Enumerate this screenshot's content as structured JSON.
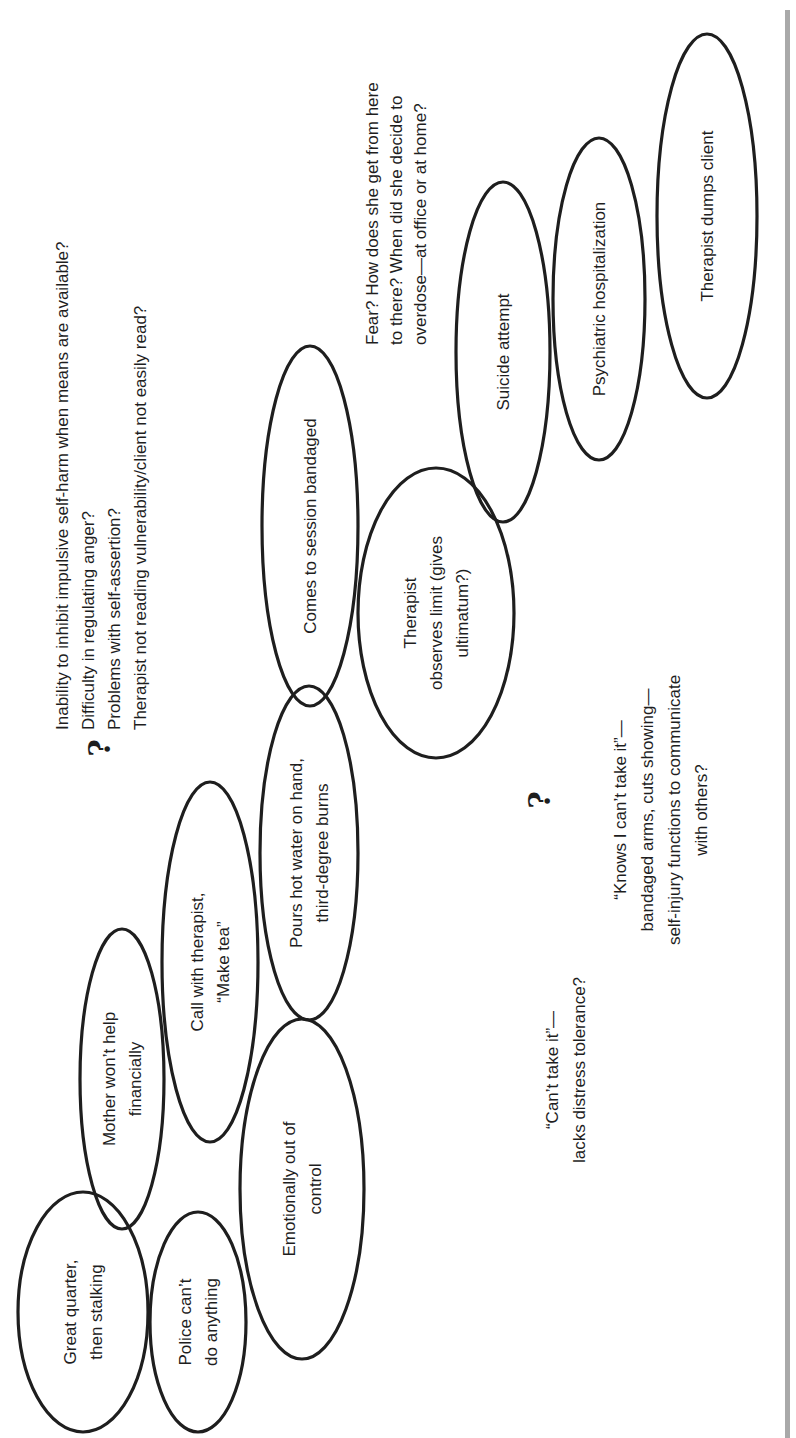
{
  "figure": {
    "orientation": "rotated-90-ccw",
    "colors": {
      "stroke": "#1e1e1e",
      "text": "#1e1e1e",
      "side_bar": "#a9a9a9",
      "background": "#ffffff"
    },
    "nodes": [
      {
        "id": "great-quarter",
        "lines": [
          "Great quarter,",
          "then stalking"
        ],
        "cx": 83,
        "cy": 1312,
        "rx": 65,
        "ry": 120
      },
      {
        "id": "police",
        "lines": [
          "Police can’t",
          "do anything"
        ],
        "cx": 198,
        "cy": 1322,
        "rx": 48,
        "ry": 110
      },
      {
        "id": "mother",
        "lines": [
          "Mother won’t help",
          "financially"
        ],
        "cx": 122,
        "cy": 1079,
        "rx": 42,
        "ry": 150
      },
      {
        "id": "call-therapist",
        "lines": [
          "Call with therapist,",
          "“Make tea”"
        ],
        "cx": 210,
        "cy": 962,
        "rx": 48,
        "ry": 180
      },
      {
        "id": "emotionally",
        "lines": [
          "Emotionally out of",
          "control"
        ],
        "cx": 302,
        "cy": 1189,
        "rx": 62,
        "ry": 170
      },
      {
        "id": "pours-water",
        "lines": [
          "Pours hot water on hand,",
          "third-degree burns"
        ],
        "cx": 309,
        "cy": 853,
        "rx": 49,
        "ry": 167
      },
      {
        "id": "comes-bandaged",
        "lines": [
          "Comes to session bandaged"
        ],
        "cx": 310,
        "cy": 526,
        "rx": 48,
        "ry": 180
      },
      {
        "id": "observes-limit",
        "lines": [
          "Therapist",
          "observes limit (gives",
          "ultimatum?)"
        ],
        "cx": 436,
        "cy": 613,
        "rx": 78,
        "ry": 145
      },
      {
        "id": "suicide-attempt",
        "lines": [
          "Suicide attempt"
        ],
        "cx": 503,
        "cy": 352,
        "rx": 47,
        "ry": 170
      },
      {
        "id": "hospitalization",
        "lines": [
          "Psychiatric hospitalization"
        ],
        "cx": 599,
        "cy": 299,
        "rx": 46,
        "ry": 161
      },
      {
        "id": "dumps-client",
        "lines": [
          "Therapist dumps client"
        ],
        "cx": 707,
        "cy": 216,
        "rx": 50,
        "ry": 182
      }
    ],
    "question_marks": [
      {
        "id": "qmark-top",
        "symbol": "?",
        "x": 100,
        "y": 748
      },
      {
        "id": "qmark-bottom",
        "symbol": "?",
        "x": 540,
        "y": 800
      }
    ],
    "notes": [
      {
        "id": "vulnerability-notes",
        "anchor_x": 62,
        "anchor_y": 730,
        "align": "start",
        "line_gap": 26,
        "lines": [
          "Inability to inhibit impulsive self-harm when means are available?",
          "Difficulty in regulating anger?",
          "Problems with self-assertion?",
          "Therapist not reading vulnerability/client not easily read?"
        ]
      },
      {
        "id": "fear-notes",
        "anchor_x": 372,
        "anchor_y": 345,
        "align": "start",
        "line_gap": 24,
        "lines": [
          "Fear? How does she get from here",
          "to there?  When did she decide to",
          "overdose—at office or at home?"
        ]
      },
      {
        "id": "cant-take-it-notes",
        "anchor_x": 552,
        "anchor_y": 1070,
        "align": "middle",
        "line_gap": 27,
        "lines": [
          "“Can’t take it”—",
          "lacks distress tolerance?"
        ]
      },
      {
        "id": "knows-notes",
        "anchor_x": 620,
        "anchor_y": 810,
        "align": "middle",
        "line_gap": 27,
        "lines": [
          "“Knows I can’t take it”—",
          "bandaged arms, cuts showing—",
          "self-injury functions to communicate",
          "with others?"
        ]
      }
    ],
    "side_bar": {
      "x": 785,
      "y": 10,
      "width": 5,
      "height": 1428
    }
  }
}
